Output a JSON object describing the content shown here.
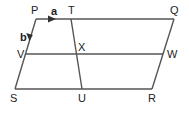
{
  "diagram": {
    "type": "parallelogram-vectors",
    "points": {
      "P": {
        "label": "P",
        "x": 36,
        "y": 19
      },
      "T": {
        "label": "T",
        "x": 71,
        "y": 19
      },
      "Q": {
        "label": "Q",
        "x": 174,
        "y": 19
      },
      "V": {
        "label": "V",
        "x": 25,
        "y": 54
      },
      "X": {
        "label": "X",
        "x": 77,
        "y": 54
      },
      "W": {
        "label": "W",
        "x": 163,
        "y": 54
      },
      "S": {
        "label": "S",
        "x": 15,
        "y": 89
      },
      "U": {
        "label": "U",
        "x": 82,
        "y": 89
      },
      "R": {
        "label": "R",
        "x": 152,
        "y": 89
      }
    },
    "vectors": {
      "a": {
        "label": "a",
        "from": "P",
        "direction": "toward T"
      },
      "b": {
        "label": "b",
        "from": "P",
        "direction": "toward S"
      }
    },
    "segments": [
      "PQ",
      "QR",
      "RS",
      "SP",
      "TU",
      "VW"
    ]
  }
}
